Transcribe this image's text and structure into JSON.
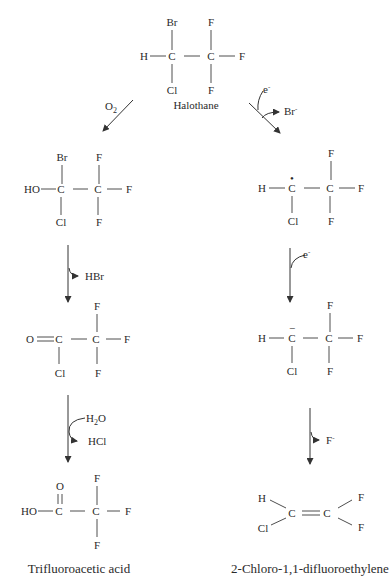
{
  "start": {
    "name": "Halothane",
    "atoms": {
      "br": "Br",
      "h": "H",
      "c1": "C",
      "c2": "C",
      "cl": "Cl",
      "f_top": "F",
      "f_right": "F",
      "f_bottom": "F"
    }
  },
  "left_branch": {
    "step1_reagent": "O",
    "step1_reagent_sub": "2",
    "intermediate1": {
      "br": "Br",
      "ho": "HO",
      "c1": "C",
      "c2": "C",
      "cl": "Cl",
      "f_top": "F",
      "f_right": "F",
      "f_bottom": "F"
    },
    "step2_byproduct": "HBr",
    "intermediate2": {
      "o": "O",
      "c1": "C",
      "c2": "C",
      "cl": "Cl",
      "f_top": "F",
      "f_right": "F",
      "f_bottom": "F"
    },
    "step3_reagent": "H",
    "step3_reagent_sub": "2",
    "step3_reagent_tail": "O",
    "step3_byproduct": "HCl",
    "product": {
      "o": "O",
      "ho": "HO",
      "c1": "C",
      "c2": "C",
      "f_top": "F",
      "f_right": "F",
      "f_bottom": "F"
    },
    "product_name": "Trifluoroacetic acid"
  },
  "right_branch": {
    "step1_reagent": "e",
    "step1_reagent_sup": "-",
    "step1_byproduct": "Br",
    "step1_byproduct_sup": "-",
    "intermediate1": {
      "h": "H",
      "c1": "C",
      "c1_mark": "•",
      "c2": "C",
      "cl": "Cl",
      "f_top": "F",
      "f_right": "F",
      "f_bottom": "F"
    },
    "step2_reagent": "e",
    "step2_reagent_sup": "-",
    "intermediate2": {
      "h": "H",
      "c1": "C",
      "c1_mark": "−",
      "c2": "C",
      "cl": "Cl",
      "f_top": "F",
      "f_right": "F",
      "f_bottom": "F"
    },
    "step3_byproduct": "F",
    "step3_byproduct_sup": "-",
    "product": {
      "h": "H",
      "cl": "Cl",
      "c1": "C",
      "c2": "C",
      "f_top": "F",
      "f_bottom": "F"
    },
    "product_name": "2-Chloro-1,1-difluoroethylene"
  }
}
